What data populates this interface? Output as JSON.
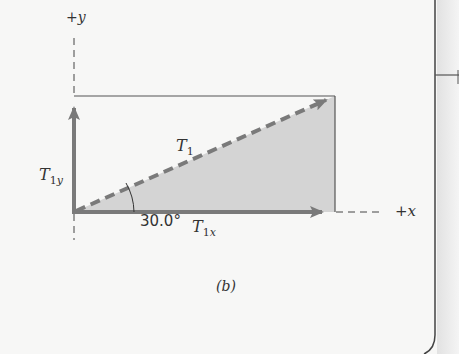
{
  "figure": {
    "caption": "(b)",
    "axis_y_label": "+y",
    "axis_x_label": "+x",
    "vector_main": {
      "name": "T",
      "sub": "1"
    },
    "vector_y": {
      "name": "T",
      "sub": "1y"
    },
    "vector_x": {
      "name": "T",
      "sub": "1x"
    },
    "angle_label": "30.0°"
  },
  "colors": {
    "vector": "#7a7a7a",
    "fill": "#d4d4d4",
    "line": "#555555",
    "background": "#f7f7f6"
  }
}
